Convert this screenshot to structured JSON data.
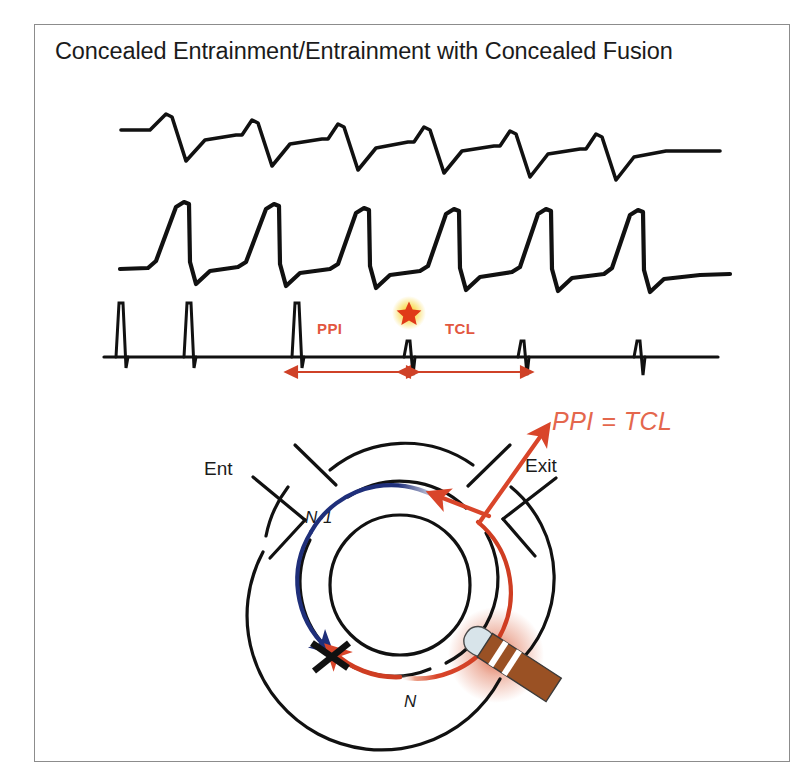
{
  "slide": {
    "title": "Concealed Entrainment/Entrainment with Concealed Fusion",
    "background_color": "#ffffff",
    "border_color": "#8c8c8c"
  },
  "colors": {
    "trace_black": "#111111",
    "accent_red": "#e2573f",
    "arrow_red": "#d9452a",
    "wavefront_blue": "#1f2f7a",
    "star_core": "#e03a18",
    "star_glow": "#f2c300",
    "catheter_body": "#9a5124",
    "catheter_tip": "#d8e4ea",
    "catheter_band": "#ffffff",
    "glow_orange": "#e2603a"
  },
  "tracings": [
    {
      "name": "surface-ecg-lead-1",
      "beats": 6,
      "description": "sawtooth flutter-like waveform, slow upslope with sharp negative deflection"
    },
    {
      "name": "surface-ecg-lead-2",
      "beats": 6,
      "description": "taller steeper sawtooth waveform with sharp vertical downstroke"
    },
    {
      "name": "intracardiac-pacing-channel",
      "pacing_spikes": 3,
      "return_deflections": 3,
      "description": "baseline with three tall pacing stimulus artifacts followed by small biphasic electrograms"
    }
  ],
  "measurements": {
    "ppi_label": "PPI",
    "tcl_label": "TCL",
    "star_marker": "star-marker",
    "relation": "PPI  =  TCL"
  },
  "circuit": {
    "entrance_label": "Ent",
    "exit_label": "Exit",
    "wavefront_previous_label": "N-1",
    "wavefront_current_label": "N",
    "block_line": "line-of-block",
    "catheter": "pacing-catheter"
  }
}
